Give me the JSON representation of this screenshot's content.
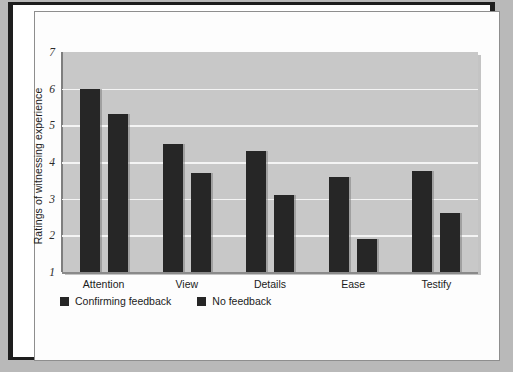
{
  "chart_data": {
    "type": "bar",
    "title": "",
    "xlabel": "",
    "ylabel": "Ratings of witnessing experience",
    "ylim": [
      1,
      7
    ],
    "yticks": [
      7,
      6,
      5,
      4,
      3,
      2,
      1
    ],
    "grid": true,
    "legend_position": "bottom-left",
    "categories": [
      "Attention",
      "View",
      "Details",
      "Ease",
      "Testify"
    ],
    "series": [
      {
        "name": "Confirming feedback",
        "color": "#262626",
        "values": [
          6.0,
          4.5,
          4.3,
          3.6,
          3.75
        ]
      },
      {
        "name": "No feedback",
        "color": "#262626",
        "values": [
          5.3,
          3.7,
          3.1,
          1.9,
          2.6
        ]
      }
    ]
  },
  "figure": {
    "plot_background": "#c8c8c8",
    "gridline_color": "#f4f4f4",
    "page_background": "#ffffff",
    "frame_color": "#1e1e1e"
  }
}
